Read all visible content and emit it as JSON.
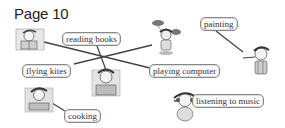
{
  "page": {
    "title": "Page 10"
  },
  "labels": [
    {
      "id": "reading-books",
      "text": "reading books"
    },
    {
      "id": "painting",
      "text": "painting"
    },
    {
      "id": "flying-kites",
      "text": "flying kites"
    },
    {
      "id": "playing-computer",
      "text": "playing computer"
    },
    {
      "id": "cooking",
      "text": "cooking"
    },
    {
      "id": "listening-to-music",
      "text": "listening to music"
    }
  ],
  "pictures": [
    {
      "id": "child-reading",
      "description": "child reading a book"
    },
    {
      "id": "child-flying-kite",
      "description": "child holding kites"
    },
    {
      "id": "child-playing-computer",
      "description": "child at a computer"
    },
    {
      "id": "child-painting",
      "description": "child painting"
    },
    {
      "id": "child-cooking",
      "description": "child cooking"
    },
    {
      "id": "child-listening-music",
      "description": "child with headphones"
    }
  ],
  "colors": {
    "line": "#444444",
    "label_border": "#888888",
    "text": "#333333"
  }
}
